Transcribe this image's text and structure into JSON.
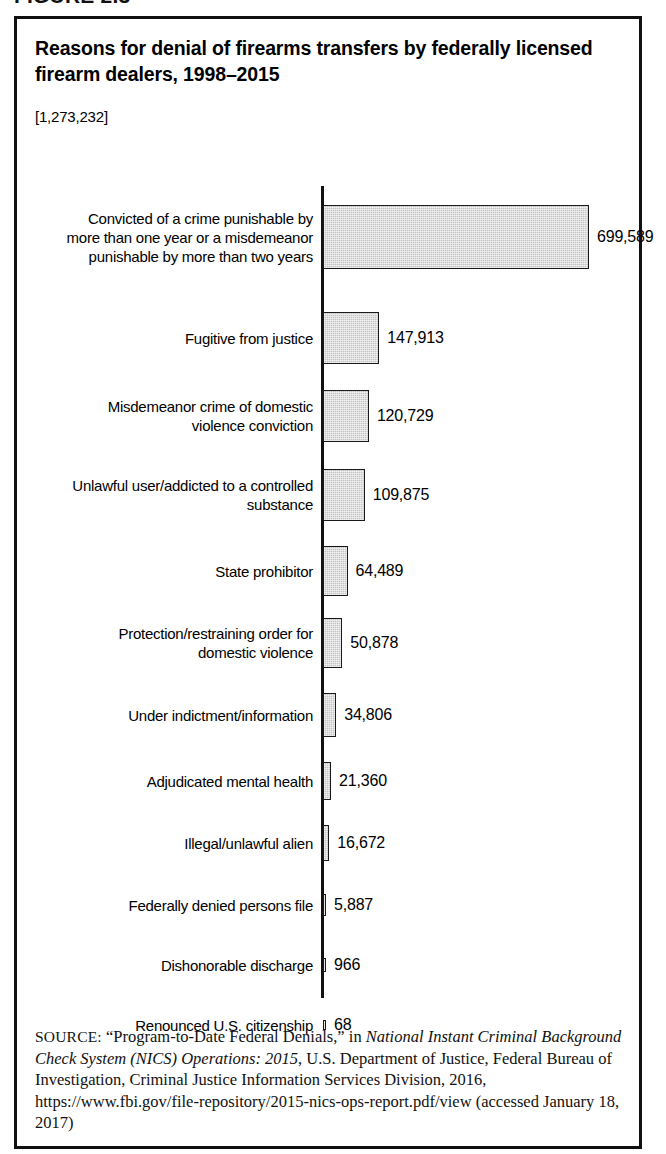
{
  "figure": {
    "number_label": "FIGURE 2.3"
  },
  "chart_title": "Reasons for denial of firearms transfers by federally licensed firearm dealers, 1998–2015",
  "chart_subtitle": "[1,273,232]",
  "source": {
    "label": "SOURCE:",
    "part1": " “Program-to-Date Federal Denials,” in ",
    "italic1": "National Instant Criminal Background Check System (NICS) Operations: 2015",
    "part2": ", U.S. Department of Justice, Federal Bureau of Investigation, Criminal Justice Information Services Division, 2016, https://www.fbi.gov/file-repository/2015-nics-ops-report.pdf/view (accessed January 18, 2017)"
  },
  "chart_data": {
    "type": "bar",
    "orientation": "horizontal",
    "title": "Reasons for denial of firearms transfers by federally licensed firearm dealers, 1998–2015",
    "subtitle": "[1,273,232]",
    "total": 1273232,
    "xlabel": "",
    "ylabel": "",
    "grid": false,
    "legend": "none",
    "xlim": [
      0,
      699589
    ],
    "bar_color": "#c3c3c3",
    "bar_edge_color": "#1a1a1a",
    "categories": [
      "Convicted of a crime punishable by\nmore than one year or a misdemeanor\npunishable by more than two years",
      "Fugitive from justice",
      "Misdemeanor crime of domestic\nviolence conviction",
      "Unlawful user/addicted to a controlled\nsubstance",
      "State prohibitor",
      "Protection/restraining order for\ndomestic violence",
      "Under indictment/information",
      "Adjudicated mental health",
      "Illegal/unlawful alien",
      "Federally denied persons file",
      "Dishonorable discharge",
      "Renounced U.S. citizenship"
    ],
    "values": [
      699589,
      147913,
      120729,
      109875,
      64489,
      50878,
      34806,
      21360,
      16672,
      5887,
      966,
      68
    ],
    "value_labels": [
      "699,589",
      "147,913",
      "120,729",
      "109,875",
      "64,489",
      "50,878",
      "34,806",
      "21,360",
      "16,672",
      "5,887",
      "966",
      "68"
    ]
  }
}
